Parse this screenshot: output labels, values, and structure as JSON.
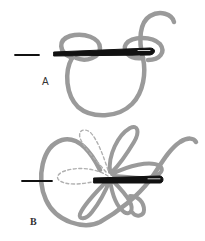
{
  "diagram": {
    "colors": {
      "thread": "#9a9a9a",
      "thread_dashed": "#b0b0b0",
      "needle": "#111111",
      "background": "#ffffff"
    },
    "panels": [
      {
        "id": "A",
        "label": "A",
        "description": "Needle passed through two thread loops"
      },
      {
        "id": "B",
        "label": "B",
        "description": "Needle passed through petal loops with dashed previous positions"
      }
    ]
  }
}
